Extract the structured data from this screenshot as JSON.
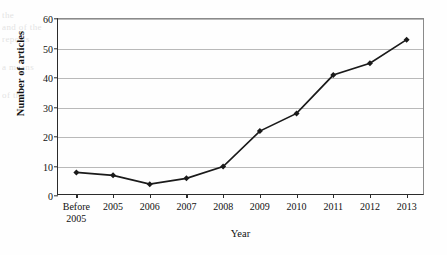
{
  "figure": {
    "background_color": "#fefefe",
    "ink_color": "#1a1a1a",
    "grid_color": "#b9b9b9",
    "axis_color": "#2b2b2b"
  },
  "ghost_text": {
    "line1": "the",
    "line2": "and  of  the",
    "line3": "reports",
    "line4": "a  means",
    "line5": "of  the"
  },
  "chart_data": {
    "type": "line",
    "title": "",
    "xlabel": "Year",
    "ylabel": "Number of articles",
    "categories": [
      "Before\n2005",
      "2005",
      "2006",
      "2007",
      "2008",
      "2009",
      "2010",
      "2011",
      "2012",
      "2013"
    ],
    "values": [
      8,
      7,
      4,
      6,
      10,
      22,
      28,
      41,
      45,
      53
    ],
    "ylim": [
      0,
      60
    ],
    "ytick_labels": [
      "0",
      "10",
      "20",
      "30",
      "40",
      "50",
      "60"
    ],
    "ytick_values": [
      0,
      10,
      20,
      30,
      40,
      50,
      60
    ],
    "grid": "horizontal",
    "legend": "none",
    "marker": "filled-diamond",
    "line_color": "#1a1a1a",
    "marker_color": "#1a1a1a"
  }
}
